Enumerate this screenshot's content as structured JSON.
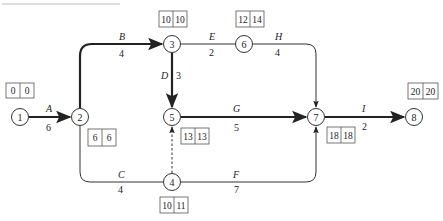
{
  "diagram": {
    "type": "activity-on-arrow network (critical path)",
    "nodes": [
      {
        "id": "1",
        "label": "1",
        "x": 20,
        "y": 117,
        "es": "0",
        "ls": "0",
        "box": {
          "x": 6,
          "y": 82
        }
      },
      {
        "id": "2",
        "label": "2",
        "x": 80,
        "y": 117,
        "es": "6",
        "ls": "6",
        "box": {
          "x": 88,
          "y": 129
        }
      },
      {
        "id": "3",
        "label": "3",
        "x": 172,
        "y": 44,
        "es": "10",
        "ls": "10",
        "box": {
          "x": 160,
          "y": 10
        }
      },
      {
        "id": "6",
        "label": "6",
        "x": 244,
        "y": 44,
        "es": "12",
        "ls": "14",
        "box": {
          "x": 236,
          "y": 10
        }
      },
      {
        "id": "5",
        "label": "5",
        "x": 172,
        "y": 117,
        "es": "13",
        "ls": "13",
        "box": {
          "x": 182,
          "y": 128
        }
      },
      {
        "id": "4",
        "label": "4",
        "x": 172,
        "y": 182,
        "es": "10",
        "ls": "11",
        "box": {
          "x": 160,
          "y": 196
        }
      },
      {
        "id": "7",
        "label": "7",
        "x": 316,
        "y": 117,
        "es": "18",
        "ls": "18",
        "box": {
          "x": 327,
          "y": 128
        }
      },
      {
        "id": "8",
        "label": "8",
        "x": 414,
        "y": 117,
        "es": "20",
        "ls": "20",
        "box": {
          "x": 407,
          "y": 82
        }
      }
    ],
    "activities": [
      {
        "name": "A",
        "duration": "6",
        "from": "1",
        "to": "2",
        "critical": true
      },
      {
        "name": "B",
        "duration": "4",
        "from": "2",
        "to": "3",
        "critical": true
      },
      {
        "name": "C",
        "duration": "4",
        "from": "2",
        "to": "4",
        "critical": false
      },
      {
        "name": "D",
        "duration": "3",
        "from": "3",
        "to": "5",
        "critical": true
      },
      {
        "name": "E",
        "duration": "2",
        "from": "3",
        "to": "6",
        "critical": false
      },
      {
        "name": "F",
        "duration": "7",
        "from": "4",
        "to": "7",
        "critical": false
      },
      {
        "name": "G",
        "duration": "5",
        "from": "5",
        "to": "7",
        "critical": true
      },
      {
        "name": "H",
        "duration": "4",
        "from": "6",
        "to": "7",
        "critical": false
      },
      {
        "name": "I",
        "duration": "2",
        "from": "7",
        "to": "8",
        "critical": true
      },
      {
        "name": "dummy",
        "duration": "",
        "from": "4",
        "to": "5",
        "critical": false,
        "dashed": true
      }
    ],
    "colors": {
      "line": "#333333",
      "box_border": "#555555",
      "background": "#ffffff"
    }
  }
}
